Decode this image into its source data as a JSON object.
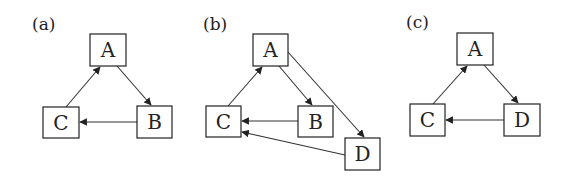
{
  "panels": [
    {
      "label": "(a)",
      "label_pos": [
        32,
        30
      ],
      "nodes": [
        {
          "id": "A",
          "text": "A",
          "x": 90,
          "y": 34,
          "w": 36,
          "h": 32
        },
        {
          "id": "B",
          "text": "B",
          "x": 137,
          "y": 106,
          "w": 35,
          "h": 32
        },
        {
          "id": "C",
          "text": "C",
          "x": 43,
          "y": 107,
          "w": 36,
          "h": 31
        }
      ],
      "edges": [
        {
          "from": "A",
          "to": "B",
          "x1": 117,
          "y1": 66,
          "x2": 151,
          "y2": 105
        },
        {
          "from": "B",
          "to": "C",
          "x1": 137,
          "y1": 122,
          "x2": 80,
          "y2": 122
        },
        {
          "from": "C",
          "to": "A",
          "x1": 66,
          "y1": 107,
          "x2": 100,
          "y2": 67
        }
      ]
    },
    {
      "label": "(b)",
      "label_pos": [
        203,
        30
      ],
      "nodes": [
        {
          "id": "A",
          "text": "A",
          "x": 253,
          "y": 34,
          "w": 35,
          "h": 32
        },
        {
          "id": "B",
          "text": "B",
          "x": 298,
          "y": 106,
          "w": 35,
          "h": 31
        },
        {
          "id": "C",
          "text": "C",
          "x": 206,
          "y": 106,
          "w": 35,
          "h": 31
        },
        {
          "id": "D",
          "text": "D",
          "x": 345,
          "y": 138,
          "w": 35,
          "h": 32
        }
      ],
      "edges": [
        {
          "from": "A",
          "to": "B",
          "x1": 279,
          "y1": 66,
          "x2": 312,
          "y2": 105
        },
        {
          "from": "A",
          "to": "D",
          "x1": 288,
          "y1": 52,
          "x2": 364,
          "y2": 137
        },
        {
          "from": "B",
          "to": "C",
          "x1": 298,
          "y1": 121,
          "x2": 242,
          "y2": 121
        },
        {
          "from": "C",
          "to": "A",
          "x1": 228,
          "y1": 106,
          "x2": 262,
          "y2": 67
        },
        {
          "from": "D",
          "to": "C",
          "x1": 345,
          "y1": 155,
          "x2": 242,
          "y2": 132
        }
      ]
    },
    {
      "label": "(c)",
      "label_pos": [
        406,
        28
      ],
      "nodes": [
        {
          "id": "A",
          "text": "A",
          "x": 457,
          "y": 33,
          "w": 36,
          "h": 32
        },
        {
          "id": "C",
          "text": "C",
          "x": 410,
          "y": 104,
          "w": 35,
          "h": 32
        },
        {
          "id": "D",
          "text": "D",
          "x": 504,
          "y": 104,
          "w": 36,
          "h": 32
        }
      ],
      "edges": [
        {
          "from": "A",
          "to": "D",
          "x1": 484,
          "y1": 65,
          "x2": 518,
          "y2": 103
        },
        {
          "from": "D",
          "to": "C",
          "x1": 504,
          "y1": 120,
          "x2": 446,
          "y2": 120
        },
        {
          "from": "C",
          "to": "A",
          "x1": 433,
          "y1": 104,
          "x2": 467,
          "y2": 66
        }
      ]
    }
  ],
  "colors": {
    "stroke": "#222222",
    "background": "#ffffff"
  }
}
